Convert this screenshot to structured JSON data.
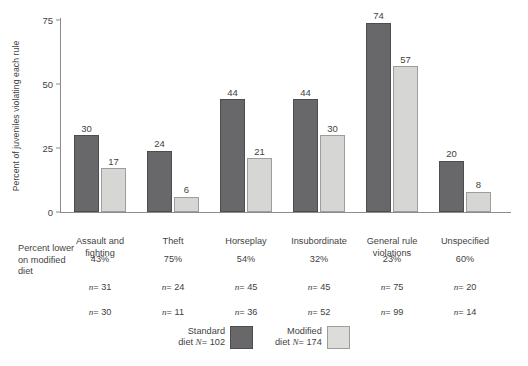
{
  "chart_data": {
    "type": "bar",
    "title": "",
    "xlabel": "",
    "ylabel": "Percent of juveniles violating each rule",
    "ylim": [
      0,
      75
    ],
    "yticks": [
      0,
      25,
      50,
      75
    ],
    "grid": false,
    "legend_position": "bottom-center",
    "categories": [
      "Assault and fighting",
      "Theft",
      "Horseplay",
      "Insubordinate",
      "General rule violations",
      "Unspecified"
    ],
    "series": [
      {
        "name": "Standard diet N= 102",
        "color": "#68686a",
        "values": [
          30,
          24,
          44,
          44,
          74,
          20
        ]
      },
      {
        "name": "Modified diet N= 174",
        "color": "#d6d6d4",
        "values": [
          17,
          6,
          21,
          30,
          57,
          8
        ]
      }
    ],
    "annotations": {
      "percent_lower_label": "Percent lower on modified diet",
      "percent_lower": [
        "43%",
        "75%",
        "54%",
        "32%",
        "23%",
        "60%"
      ],
      "n_standard": [
        "n= 31",
        "n= 24",
        "n= 45",
        "n= 45",
        "n= 75",
        "n= 20"
      ],
      "n_modified": [
        "n= 30",
        "n= 11",
        "n= 36",
        "n= 52",
        "n= 99",
        "n= 14"
      ]
    }
  },
  "axis": {
    "y_label": "Percent of juveniles violating each rule",
    "ticks": [
      "75",
      "50",
      "25",
      "0"
    ]
  },
  "categories": [
    {
      "line1": "Assault and",
      "line2": "fighting"
    },
    {
      "line1": "Theft",
      "line2": ""
    },
    {
      "line1": "Horseplay",
      "line2": ""
    },
    {
      "line1": "Insubordinate",
      "line2": ""
    },
    {
      "line1": "General rule",
      "line2": "violations"
    },
    {
      "line1": "Unspecified",
      "line2": ""
    }
  ],
  "bars": {
    "standard": [
      "30",
      "24",
      "44",
      "44",
      "74",
      "20"
    ],
    "modified": [
      "17",
      "6",
      "21",
      "30",
      "57",
      "8"
    ]
  },
  "table": {
    "row_label_l1": "Percent lower",
    "row_label_l2": "on modified",
    "row_label_l3": "diet",
    "percent_lower": [
      "43%",
      "75%",
      "54%",
      "32%",
      "23%",
      "60%"
    ],
    "n_standard": [
      "31",
      "24",
      "45",
      "45",
      "75",
      "20"
    ],
    "n_modified": [
      "30",
      "11",
      "36",
      "52",
      "99",
      "14"
    ],
    "n_prefix": "n",
    "n_sep": "= "
  },
  "legend": {
    "standard": {
      "line1": "Standard",
      "line2_pre": "diet ",
      "line2_n": "N",
      "line2_post": "= 102"
    },
    "modified": {
      "line1": "Modified",
      "line2_pre": "diet ",
      "line2_n": "N",
      "line2_post": "= 174"
    }
  }
}
